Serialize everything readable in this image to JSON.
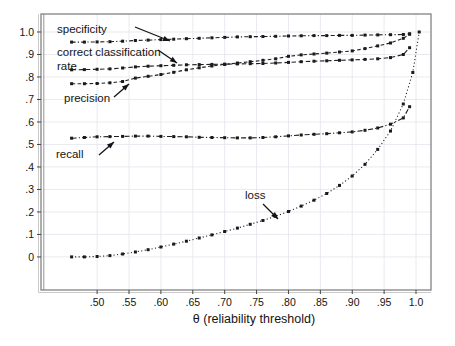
{
  "chart_data": {
    "type": "line",
    "title": "",
    "xlabel": "θ (reliability threshold)",
    "ylabel": "",
    "grid": true,
    "legend_position": "none (inline annotations with arrows)",
    "xlim": [
      0.412,
      1.0235
    ],
    "ylim": [
      -0.147,
      1.08
    ],
    "x": [
      0.46,
      0.48,
      0.5,
      0.52,
      0.54,
      0.56,
      0.58,
      0.6,
      0.62,
      0.64,
      0.66,
      0.68,
      0.7,
      0.72,
      0.74,
      0.76,
      0.78,
      0.8,
      0.82,
      0.84,
      0.86,
      0.88,
      0.9,
      0.92,
      0.94,
      0.96,
      0.98,
      0.99
    ],
    "series": [
      {
        "name": "specificity",
        "dash": "4,2.2,1.2,2.2",
        "values": [
          0.955,
          0.955,
          0.956,
          0.957,
          0.959,
          0.962,
          0.964,
          0.966,
          0.968,
          0.97,
          0.972,
          0.974,
          0.976,
          0.978,
          0.979,
          0.98,
          0.981,
          0.982,
          0.983,
          0.984,
          0.984,
          0.985,
          0.985,
          0.986,
          0.987,
          0.988,
          0.989,
          0.992
        ]
      },
      {
        "name": "correct classification rate",
        "dash": "4.5,2.6",
        "values": [
          0.832,
          0.833,
          0.834,
          0.836,
          0.84,
          0.845,
          0.848,
          0.85,
          0.852,
          0.854,
          0.855,
          0.856,
          0.857,
          0.858,
          0.859,
          0.86,
          0.862,
          0.865,
          0.868,
          0.87,
          0.872,
          0.874,
          0.876,
          0.878,
          0.881,
          0.886,
          0.9,
          0.93
        ]
      },
      {
        "name": "precision",
        "dash": "3.6,2.4",
        "values": [
          0.77,
          0.77,
          0.771,
          0.774,
          0.78,
          0.795,
          0.803,
          0.811,
          0.821,
          0.832,
          0.841,
          0.849,
          0.856,
          0.862,
          0.868,
          0.874,
          0.881,
          0.892,
          0.898,
          0.902,
          0.906,
          0.911,
          0.916,
          0.926,
          0.938,
          0.951,
          0.972,
          0.99
        ]
      },
      {
        "name": "recall",
        "dash": "5,2.2,1.2,2.2",
        "values": [
          0.528,
          0.531,
          0.534,
          0.535,
          0.536,
          0.537,
          0.537,
          0.536,
          0.535,
          0.534,
          0.532,
          0.531,
          0.53,
          0.529,
          0.529,
          0.531,
          0.534,
          0.538,
          0.542,
          0.545,
          0.548,
          0.552,
          0.556,
          0.563,
          0.573,
          0.59,
          0.618,
          0.668
        ]
      },
      {
        "name": "loss",
        "dash": "1.1,2.4",
        "x": [
          0.46,
          0.48,
          0.5,
          0.52,
          0.54,
          0.56,
          0.58,
          0.6,
          0.62,
          0.64,
          0.66,
          0.68,
          0.7,
          0.72,
          0.74,
          0.76,
          0.78,
          0.8,
          0.82,
          0.84,
          0.86,
          0.88,
          0.9,
          0.92,
          0.94,
          0.96,
          0.98,
          0.995,
          1.005
        ],
        "values": [
          0.0,
          0.0,
          0.002,
          0.006,
          0.013,
          0.022,
          0.032,
          0.044,
          0.057,
          0.07,
          0.084,
          0.098,
          0.113,
          0.128,
          0.145,
          0.162,
          0.181,
          0.202,
          0.226,
          0.252,
          0.282,
          0.318,
          0.36,
          0.412,
          0.478,
          0.56,
          0.68,
          0.82,
          1.0
        ]
      }
    ],
    "xticks": {
      "values": [
        0.5,
        0.55,
        0.6,
        0.65,
        0.7,
        0.75,
        0.8,
        0.85,
        0.9,
        0.95,
        1.0
      ],
      "labels": [
        ".50",
        ".55",
        ".60",
        ".65",
        ".70",
        ".75",
        ".80",
        ".85",
        ".90",
        ".95",
        "1.0"
      ]
    },
    "yticks": {
      "values": [
        0,
        0.1,
        0.2,
        0.3,
        0.4,
        0.5,
        0.6,
        0.7,
        0.8,
        0.9,
        1.0
      ],
      "labels": [
        "0",
        ".1",
        ".2",
        ".3",
        ".4",
        ".5",
        ".6",
        ".7",
        ".8",
        ".9",
        "1.0"
      ]
    },
    "annotations": [
      {
        "text": "specificity",
        "x": 57,
        "y": 33,
        "arrow": [
          135,
          27,
          170,
          41
        ]
      },
      {
        "text": "correct classification",
        "x": 57,
        "y": 56,
        "arrow": [
          158,
          50,
          177,
          63
        ]
      },
      {
        "text": "rate",
        "x": 57,
        "y": 70
      },
      {
        "text": "precision",
        "x": 64,
        "y": 102,
        "arrow": [
          114,
          97,
          129,
          84
        ]
      },
      {
        "text": "recall",
        "x": 56,
        "y": 158,
        "arrow": [
          99,
          155,
          114,
          142
        ]
      },
      {
        "text": "loss",
        "x": 245,
        "y": 199,
        "arrow": [
          263,
          204,
          278,
          219
        ]
      }
    ],
    "colors": {
      "line": "#1f1f1f",
      "marker": "#1a1a1a",
      "grid": "#e3e4ec",
      "frame": "#787878",
      "frame_soft": "#c4c4c4",
      "tick": "#454545",
      "text": "#141414",
      "background": "#ffffff"
    },
    "plot_rect": {
      "x": 41,
      "y": 14,
      "w": 390,
      "h": 276
    }
  }
}
